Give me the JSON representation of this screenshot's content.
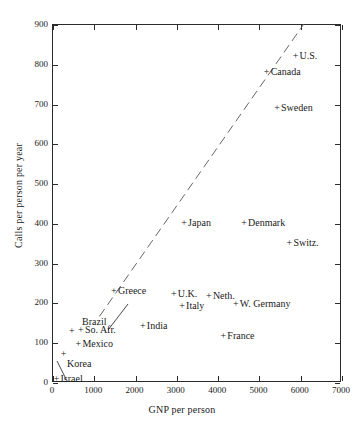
{
  "chart_data": {
    "type": "scatter",
    "title": "",
    "xlabel": "GNP per person",
    "ylabel": "Calls per person per year",
    "xlim": [
      0,
      7000
    ],
    "ylim": [
      0,
      900
    ],
    "xticks": [
      0,
      1000,
      2000,
      3000,
      4000,
      5000,
      6000,
      7000
    ],
    "yticks": [
      0,
      100,
      200,
      300,
      400,
      500,
      600,
      700,
      800,
      900
    ],
    "grid": false,
    "legend": null,
    "marker": "+",
    "points": [
      {
        "label": "U.S.",
        "x": 5900,
        "y": 820,
        "label_dx": 4,
        "label_dy": 0
      },
      {
        "label": "Canada",
        "x": 5200,
        "y": 780,
        "label_dx": 4,
        "label_dy": 0
      },
      {
        "label": "Sweden",
        "x": 5450,
        "y": 690,
        "label_dx": 4,
        "label_dy": 0
      },
      {
        "label": "Denmark",
        "x": 4650,
        "y": 400,
        "label_dx": 4,
        "label_dy": 0
      },
      {
        "label": "Switz.",
        "x": 5750,
        "y": 350,
        "label_dx": 4,
        "label_dy": 0
      },
      {
        "label": "Japan",
        "x": 3200,
        "y": 400,
        "label_dx": 4,
        "label_dy": 0
      },
      {
        "label": "W. Germany",
        "x": 4450,
        "y": 195,
        "label_dx": 4,
        "label_dy": 0
      },
      {
        "label": "Neth.",
        "x": 3800,
        "y": 215,
        "label_dx": 4,
        "label_dy": 0
      },
      {
        "label": "U.K.",
        "x": 2950,
        "y": 220,
        "label_dx": 4,
        "label_dy": 0
      },
      {
        "label": "Italy",
        "x": 3150,
        "y": 190,
        "label_dx": 4,
        "label_dy": 0
      },
      {
        "label": "France",
        "x": 4150,
        "y": 115,
        "label_dx": 4,
        "label_dy": 0
      },
      {
        "label": "Greece",
        "x": 1500,
        "y": 230,
        "label_dx": 4,
        "label_dy": 0
      },
      {
        "label": "India",
        "x": 2200,
        "y": 140,
        "label_dx": 4,
        "label_dy": 0
      },
      {
        "label": "So. Afr.",
        "x": 700,
        "y": 130,
        "label_dx": 4,
        "label_dy": 0
      },
      {
        "label": "Mexico",
        "x": 640,
        "y": 95,
        "label_dx": 4,
        "label_dy": 0
      },
      {
        "label": "Israel",
        "x": 110,
        "y": 8,
        "label_dx": 4,
        "label_dy": 0
      }
    ],
    "leader_points": [
      {
        "label": "Brazil",
        "x": 480,
        "y": 128,
        "label_px_x": 82,
        "label_px_y": 322,
        "leader_from": {
          "px_x": 128,
          "px_y": 304
        },
        "leader_to": {
          "px_x": 108,
          "px_y": 330
        }
      },
      {
        "label": "Korea",
        "x": 280,
        "y": 70,
        "label_px_x": 67,
        "label_px_y": 364,
        "leader_from": {
          "px_x": 66,
          "px_y": 379
        },
        "leader_to": {
          "px_x": 57,
          "px_y": 361
        }
      }
    ],
    "trendline": {
      "style": "dashed",
      "x_start": 1150,
      "y_start": 165,
      "x_end": 6100,
      "y_end": 900,
      "note": "dashed reference line rising left-to-right"
    },
    "annotations": []
  },
  "colors": {
    "axis": "#2b2b2b",
    "text": "#1a1a1a",
    "background": "#ffffff",
    "marker": "#1a1a1a",
    "trendline": "#555555"
  }
}
